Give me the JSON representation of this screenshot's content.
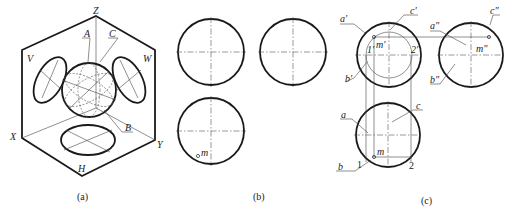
{
  "figure": {
    "panels": [
      {
        "id": "a",
        "caption": "(a)",
        "description": "Isometric view of sphere inside projection box with V, W, H planes",
        "labels": {
          "Z": "Z",
          "X": "X",
          "Y": "Y",
          "V": "V",
          "W": "W",
          "H": "H",
          "A": "A",
          "B": "B",
          "C": "C"
        }
      },
      {
        "id": "b",
        "caption": "(b)",
        "description": "Three orthographic views of sphere with point m on top view",
        "labels": {
          "m": "m"
        }
      },
      {
        "id": "c",
        "caption": "(c)",
        "description": "Solution: locating projections of point M on the sphere",
        "labels": {
          "a_prime": "a'",
          "c_prime": "c'",
          "b_prime": "b'",
          "one_prime": "1'",
          "two_prime": "2'",
          "m_prime": "m'",
          "a_dprime": "a\"",
          "b_dprime": "b\"",
          "c_dprime": "c\"",
          "m_dprime": "m\"",
          "a": "a",
          "b": "b",
          "c": "c",
          "m": "m",
          "one": "1",
          "two": "2"
        }
      }
    ]
  }
}
